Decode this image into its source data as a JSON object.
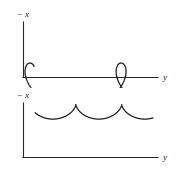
{
  "figure": {
    "background_color": "#ffffff",
    "stroke_color": "#1b1b1b",
    "axis_color": "#262626",
    "panel_count": 2
  },
  "panels": [
    {
      "id": "top",
      "curve_name": "prolate-cycloid",
      "y_axis_label": "−x",
      "y_axis_label_minus": "−",
      "y_axis_label_symbol": "x",
      "x_axis_label": "y",
      "loop_count": 3,
      "description": "prolate cycloid with three loops"
    },
    {
      "id": "bottom",
      "curve_name": "cycloid",
      "y_axis_label": "−x",
      "y_axis_label_minus": "−",
      "y_axis_label_symbol": "x",
      "x_axis_label": "y",
      "arch_count": 3,
      "description": "common cycloid with cusps"
    }
  ],
  "chart_data": [
    {
      "type": "line",
      "id": "top-prolate-cycloid",
      "title": "",
      "xlabel": "y",
      "ylabel": "−x",
      "grid": false,
      "legend": "none",
      "axis_origin_px": [
        23,
        77
      ],
      "xlim": [
        23,
        160
      ],
      "ylim": [
        77,
        22
      ],
      "parametric": {
        "equations": [
          "y = a*t - b*sin(t)",
          "x = a - b*cos(t)"
        ],
        "a": 14.5,
        "b": 23.0,
        "t_range": [
          -0.55,
          10.2
        ],
        "y_offset_px": 71.5,
        "x_offset_px": 30.0
      },
      "features": {
        "loops": 3,
        "loop_centers_x_px": [
          44,
          73,
          101
        ],
        "loop_width_px": 17,
        "crest_y_px": 31,
        "trough_y_px": 73,
        "curve_start_x_px": 33,
        "curve_end_x_px": 140
      }
    },
    {
      "type": "line",
      "id": "bottom-cycloid",
      "title": "",
      "xlabel": "y",
      "ylabel": "−x",
      "grid": false,
      "legend": "none",
      "axis_origin_px": [
        23,
        68
      ],
      "xlim": [
        23,
        160
      ],
      "ylim": [
        68,
        14
      ],
      "parametric": {
        "equations": [
          "y = a*(t - sin(t))",
          "x = a*(1 - cos(t))"
        ],
        "a": 7.3,
        "t_range": [
          1.7,
          16.3
        ],
        "y_offset_px": 15.5,
        "x_offset_px": 30.0
      },
      "features": {
        "arches": 3,
        "cusp_x_px": [
          65,
          110
        ],
        "cusp_y_px": 58,
        "crest_y_px": 34,
        "curve_start_x_px": 33,
        "curve_end_x_px": 141
      }
    }
  ]
}
